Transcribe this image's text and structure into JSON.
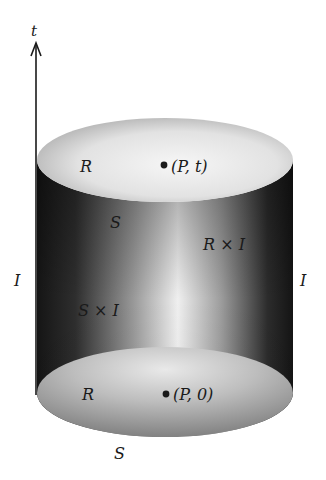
{
  "figure": {
    "axis": {
      "label": "t"
    },
    "top_disk": {
      "region_label": "R",
      "point_label": "(P, t)",
      "boundary_label": "S"
    },
    "side": {
      "left_interval_label": "I",
      "right_interval_label": "I",
      "boundary_product_label": "S × I",
      "region_product_label": "R × I"
    },
    "bottom_disk": {
      "region_label": "R",
      "point_label": "(P, 0)",
      "boundary_label": "S"
    },
    "colors": {
      "background": "#ffffff",
      "ink": "#1a1a1a",
      "cylinder_dark": "#1c1c1c",
      "cylinder_light": "#f2f2f2",
      "disk_light": "#f4f4f4",
      "disk_mid": "#a8a8a8"
    }
  }
}
